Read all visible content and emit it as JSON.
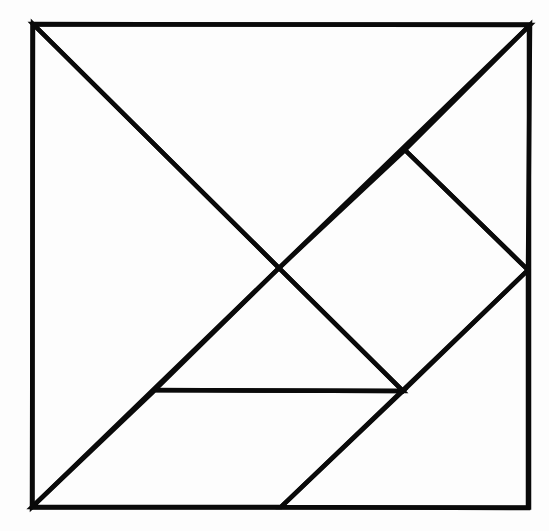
{
  "diagram": {
    "type": "tangram",
    "title": "",
    "stroke_color": "#0a0a0a",
    "background_color": "#fdfdfd",
    "vertices": {
      "top_left": [
        33,
        24
      ],
      "top_right": [
        530,
        25
      ],
      "bottom_left": [
        32,
        507
      ],
      "bottom_right": [
        528,
        508
      ],
      "center": [
        279,
        268
      ],
      "upper_right_inner": [
        405,
        150
      ],
      "right_mid": [
        528,
        270
      ],
      "mid_left": [
        155,
        390
      ],
      "mid_right": [
        403,
        391
      ],
      "bottom_mid": [
        281,
        507
      ]
    },
    "pieces": [
      {
        "name": "large-triangle-left",
        "points": "33,24 279,268 32,507"
      },
      {
        "name": "large-triangle-top",
        "points": "33,24 530,25 279,268"
      },
      {
        "name": "medium-triangle-corner",
        "points": "530,25 528,270 405,150"
      },
      {
        "name": "square",
        "points": "405,150 528,270 403,391 279,268"
      },
      {
        "name": "small-triangle-middle",
        "points": "279,268 403,391 155,390"
      },
      {
        "name": "parallelogram",
        "points": "155,390 403,391 281,507 32,507"
      },
      {
        "name": "small-triangle-bottom-right",
        "points": "528,270 528,508 281,507"
      }
    ]
  }
}
